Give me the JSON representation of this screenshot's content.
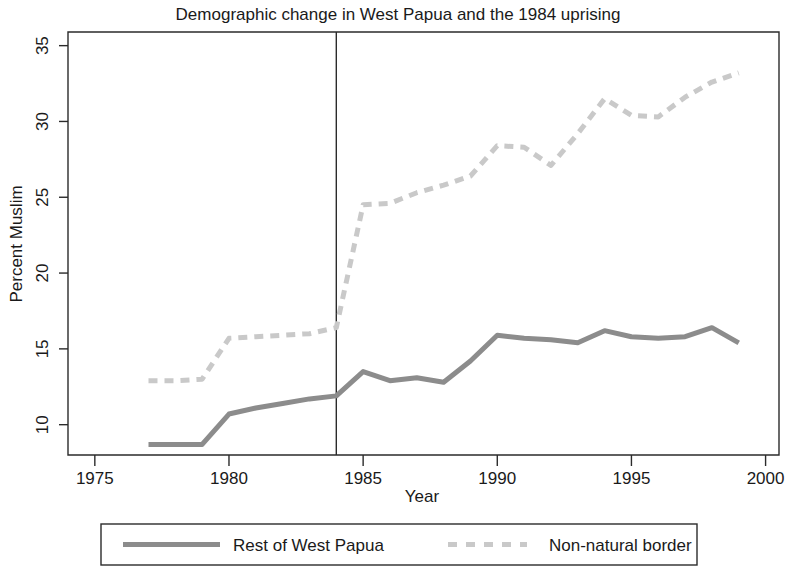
{
  "chart_data": {
    "type": "line",
    "title": "Demographic change in West Papua and the 1984 uprising",
    "xlabel": "Year",
    "ylabel": "Percent Muslim",
    "xlim": [
      1974,
      2000.5
    ],
    "ylim": [
      8.0,
      35.9
    ],
    "xticks": [
      1975,
      1980,
      1985,
      1990,
      1995,
      2000
    ],
    "yticks": [
      10,
      15,
      20,
      25,
      30,
      35
    ],
    "xtick_labels": [
      "1975",
      "1980",
      "1985",
      "1990",
      "1995",
      "2000"
    ],
    "ytick_labels": [
      "10",
      "15",
      "20",
      "25",
      "30",
      "35"
    ],
    "grid": false,
    "legend_position": "below",
    "annotations": [
      {
        "name": "uprising-reference-line",
        "type": "vline",
        "x": 1984,
        "label": "1984"
      }
    ],
    "x": [
      1977,
      1978,
      1979,
      1980,
      1981,
      1982,
      1983,
      1984,
      1985,
      1986,
      1987,
      1988,
      1989,
      1990,
      1991,
      1992,
      1993,
      1994,
      1995,
      1996,
      1997,
      1998,
      1999
    ],
    "series": [
      {
        "name": "Rest of West Papua",
        "style": "solid",
        "color": "#8c8c8c",
        "width": 5,
        "values": [
          8.7,
          8.7,
          8.7,
          10.7,
          11.1,
          11.4,
          11.7,
          11.9,
          13.5,
          12.9,
          13.1,
          12.8,
          14.2,
          15.9,
          15.7,
          15.6,
          15.4,
          16.2,
          15.8,
          15.7,
          15.8,
          16.4,
          15.4
        ]
      },
      {
        "name": "Non-natural border",
        "style": "dashed",
        "color": "#c9c9c9",
        "width": 5,
        "values": [
          12.9,
          12.9,
          13.0,
          15.7,
          15.8,
          15.9,
          16.0,
          16.4,
          24.5,
          24.6,
          25.3,
          25.8,
          26.4,
          28.4,
          28.3,
          27.1,
          29.2,
          31.5,
          30.4,
          30.3,
          31.6,
          32.6,
          33.2
        ]
      }
    ]
  },
  "legend": {
    "items": [
      {
        "label": "Rest of West Papua",
        "style": "solid",
        "color": "#8c8c8c"
      },
      {
        "label": "Non-natural border",
        "style": "dashed",
        "color": "#c9c9c9"
      }
    ]
  }
}
